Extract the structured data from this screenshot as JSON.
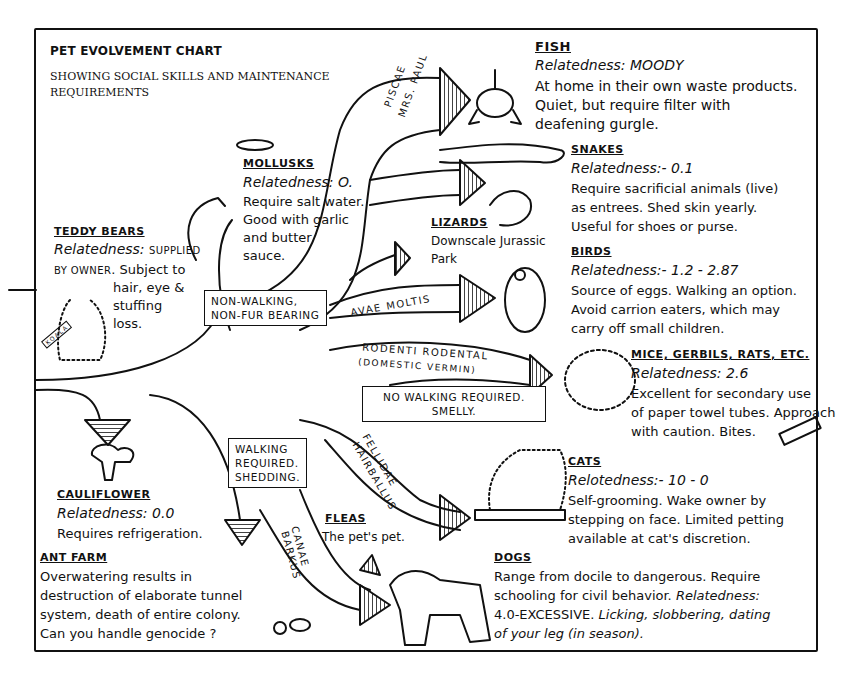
{
  "chart": {
    "title": "PET EVOLVEMENT CHART",
    "subtitle": "SHOWING SOCIAL SKILLS AND MAINTENANCE REQUIREMENTS"
  },
  "entries": {
    "teddy_bears": {
      "heading": "TEDDY BEARS",
      "relatedness_label": "Relatedness:",
      "relatedness_value": "SUPPLIED BY OWNER",
      "line1": "BY OWNER",
      "line1b": ". Subject to",
      "line2": "hair, eye &",
      "line3": "stuffing",
      "line4": "loss.",
      "tag": "KOALA"
    },
    "mollusks": {
      "heading": "MOLLUSKS",
      "relatedness": "Relatedness: O.",
      "lines": [
        "Require salt water.",
        "Good with garlic",
        "and butter",
        "sauce."
      ]
    },
    "fish": {
      "heading": "FISH",
      "relatedness": "Relatedness: MOODY",
      "lines": [
        "At home in their own waste products.",
        "Quiet, but require filter with",
        "deafening gurgle."
      ]
    },
    "snakes": {
      "heading": "SNAKES",
      "relatedness": "Relatedness:- 0.1",
      "lines": [
        "Require sacrificial animals (live)",
        "as entrees. Shed skin yearly.",
        "Useful for shoes or purse."
      ]
    },
    "lizards": {
      "heading": "LIZARDS",
      "lines": [
        "Downscale Jurassic",
        "Park"
      ]
    },
    "birds": {
      "heading": "BIRDS",
      "relatedness": "Relatedness:- 1.2 - 2.87",
      "lines": [
        "Source of eggs. Walking an option.",
        "Avoid carrion eaters, which may",
        "carry off small children."
      ]
    },
    "mice": {
      "heading": "MICE, GERBILS, RATS, ETC.",
      "relatedness": "Relatedness: 2.6",
      "lines": [
        "Excellent for secondary use",
        "of paper towel tubes. Approach",
        "with caution. Bites."
      ]
    },
    "cats": {
      "heading": "CATS",
      "relatedness": "Relotedness:- 10 - 0",
      "lines": [
        "Self-grooming. Wake owner by",
        "stepping on face. Limited petting",
        "available at cat's discretion."
      ]
    },
    "cauliflower": {
      "heading": "CAULIFLOWER",
      "relatedness": "Relatedness: 0.0",
      "lines": [
        "Requires refrigeration."
      ]
    },
    "ant_farm": {
      "heading": "ANT FARM",
      "lines": [
        "Overwatering results in",
        "destruction of elaborate tunnel",
        "system, death of entire colony.",
        "Can you handle genocide ?"
      ]
    },
    "fleas": {
      "heading": "FLEAS",
      "lines": [
        "The pet's pet."
      ]
    },
    "dogs": {
      "heading": "DOGS",
      "line1": "Range from docile to dangerous. Require",
      "line2a": "schooling for civil behavior. ",
      "line2b": "Relatedness:",
      "line3a": "4.0-EXCESSIVE. ",
      "line3b": "Licking, slobbering, dating",
      "line4": "of your leg (in season)."
    }
  },
  "branch_labels": {
    "non_walking": [
      "NON-WALKING,",
      "NON-FUR BEARING"
    ],
    "no_walking": [
      "NO WALKING REQUIRED.",
      "SMELLY."
    ],
    "walking": [
      "WALKING",
      "REQUIRED.",
      "SHEDDING."
    ]
  },
  "arrow_labels": {
    "piscae": "PISCAE",
    "mrs_paul": "MRS. PAUL",
    "avae": "AVAE MOLTIS",
    "rodenti": "RODENTI RODENTAL",
    "rodenti_sub": "(DOMESTIC VERMIN)",
    "fellidae": "FELLIDAE",
    "hairballus": "HAIRBALLUS",
    "canae": "CANAE",
    "barkus": "BARKUS"
  }
}
